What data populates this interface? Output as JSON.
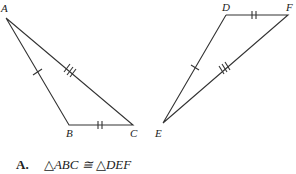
{
  "figure": {
    "stroke_color": "#333333",
    "triangle_abc": {
      "vertices": {
        "A": {
          "label": "A",
          "x": 6,
          "y": 18
        },
        "B": {
          "label": "B",
          "x": 69,
          "y": 125
        },
        "C": {
          "label": "C",
          "x": 133,
          "y": 125
        }
      },
      "tick_marks": {
        "AB": 1,
        "BC": 2,
        "AC": 3
      }
    },
    "triangle_def": {
      "vertices": {
        "D": {
          "label": "D",
          "x": 226,
          "y": 15
        },
        "E": {
          "label": "E",
          "x": 163,
          "y": 123
        },
        "F": {
          "label": "F",
          "x": 288,
          "y": 15
        }
      },
      "tick_marks": {
        "DE": 1,
        "DF": 2,
        "EF": 3
      }
    }
  },
  "answer": {
    "option": "A.",
    "statement": "△ABC ≅ △DEF"
  }
}
